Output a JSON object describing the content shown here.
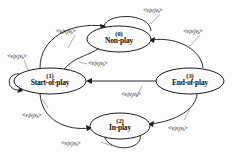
{
  "diagram": {
    "type": "state-transition-diagram",
    "title": "",
    "background_color": "#fdfdfd",
    "node_fill_color": "#fbfbfb",
    "node_stroke_color": "#1c1c1c",
    "edge_color": "#2b2b2b",
    "text_color": "#101010",
    "nodes": [
      {
        "id": "0",
        "index": "(0)",
        "name": "Non-play",
        "cx": 119,
        "cy": 39,
        "rx": 32,
        "ry": 13
      },
      {
        "id": "1",
        "index": "(1)",
        "name": "Start-of-play",
        "cx": 50,
        "cy": 81,
        "rx": 36,
        "ry": 13
      },
      {
        "id": "2",
        "index": "(2)",
        "name": "In-play",
        "cx": 120,
        "cy": 126,
        "rx": 30,
        "ry": 13
      },
      {
        "id": "3",
        "index": "(3)",
        "name": "End-of-play",
        "cx": 190,
        "cy": 81,
        "rx": 34,
        "ry": 13
      }
    ],
    "edge_labels": [
      {
        "id": "lbl-nonplay-self",
        "text": "<v_i|v_j|v_k>",
        "x": 143,
        "y": 6,
        "for_edge": "non-play self-loop"
      },
      {
        "id": "lbl-start-to-nonplay",
        "text": "<v_i|v_j|v_k>",
        "x": 56,
        "y": 27,
        "for_edge": "start-of-play to non-play"
      },
      {
        "id": "lbl-nonplay-to-end",
        "text": "<v_i|v_j|v_k>",
        "x": 183,
        "y": 27,
        "for_edge": "non-play to end-of-play"
      },
      {
        "id": "lbl-start-self",
        "text": "<v_i|v_j|v_k>",
        "x": 7,
        "y": 52,
        "for_edge": "start-of-play self-loop"
      },
      {
        "id": "lbl-nonplay-to-start",
        "text": "<v_i|v_j|v_k>",
        "x": 88,
        "y": 59,
        "for_edge": "non-play to start-of-play"
      },
      {
        "id": "lbl-end-to-start",
        "text": "<v_i|v_j|v_k>",
        "x": 121,
        "y": 90,
        "for_edge": "end-of-play to start-of-play"
      },
      {
        "id": "lbl-start-to-inplay",
        "text": "<v_i|v_j|v_k>",
        "x": 22,
        "y": 111,
        "for_edge": "start-of-play to in-play"
      },
      {
        "id": "lbl-inplay-to-end",
        "text": "<v_i|v_j|v_k>",
        "x": 168,
        "y": 124,
        "for_edge": "in-play to end-of-play"
      },
      {
        "id": "lbl-inplay-self",
        "text": "<v_i|v_j|v_k>",
        "x": 61,
        "y": 139,
        "for_edge": "in-play self-loop"
      }
    ],
    "transitions": [
      {
        "from": "1",
        "to": "0",
        "label": "<v_i|v_j|v_k>"
      },
      {
        "from": "0",
        "to": "1",
        "label": "<v_i|v_j|v_k>"
      },
      {
        "from": "0",
        "to": "0",
        "label": "<v_i|v_j|v_k>"
      },
      {
        "from": "0",
        "to": "3",
        "label": "<v_i|v_j|v_k>"
      },
      {
        "from": "1",
        "to": "1",
        "label": "<v_i|v_j|v_k>"
      },
      {
        "from": "3",
        "to": "1",
        "label": "<v_i|v_j|v_k>"
      },
      {
        "from": "1",
        "to": "2",
        "label": "<v_i|v_j|v_k>"
      },
      {
        "from": "2",
        "to": "3",
        "label": "<v_i|v_j|v_k>"
      },
      {
        "from": "2",
        "to": "2",
        "label": "<v_i|v_j|v_k>"
      }
    ]
  }
}
